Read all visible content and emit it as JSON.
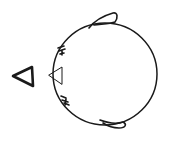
{
  "diagram": {
    "type": "hand-drawn sketch",
    "colors": {
      "stroke": "#1a1a1a",
      "background": "#ffffff"
    },
    "elements": [
      {
        "name": "direction-arrow",
        "shape": "triangle",
        "points_left": true
      },
      {
        "name": "body-circle",
        "shape": "circle"
      },
      {
        "name": "beak",
        "shape": "triangle",
        "points_left": true
      },
      {
        "name": "top-fin",
        "shape": "loop"
      },
      {
        "name": "bottom-fin",
        "shape": "loop"
      },
      {
        "name": "upper-whisker-marks",
        "shape": "scribble"
      },
      {
        "name": "lower-whisker-marks",
        "shape": "scribble"
      }
    ]
  }
}
